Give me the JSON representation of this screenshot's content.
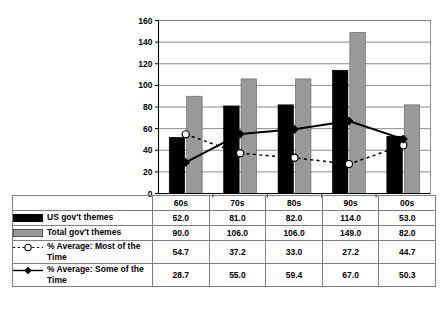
{
  "chart_data": {
    "type": "bar",
    "title": "",
    "subtitle": "",
    "xlabel": "",
    "ylabel": "",
    "categories": [
      "60s",
      "70s",
      "80s",
      "90s",
      "00s"
    ],
    "ylim": [
      0,
      160
    ],
    "y_ticks": [
      0,
      20,
      40,
      60,
      80,
      100,
      120,
      140,
      160
    ],
    "y_tick_labels": [
      "0",
      "20",
      "40",
      "60",
      "80",
      "100",
      "120",
      "140",
      "160"
    ],
    "grid": true,
    "legend_position": "table-below",
    "series": [
      {
        "name": "US gov't themes",
        "kind": "bar",
        "color": "#000000",
        "values": [
          52.0,
          81.0,
          82.0,
          114.0,
          53.0
        ],
        "display_values": [
          "52.0",
          "81.0",
          "82.0",
          "114.0",
          "53.0"
        ]
      },
      {
        "name": "Total gov't themes",
        "kind": "bar",
        "color": "#999999",
        "values": [
          90.0,
          106.0,
          106.0,
          149.0,
          82.0
        ],
        "display_values": [
          "90.0",
          "106.0",
          "106.0",
          "149.0",
          "82.0"
        ]
      },
      {
        "name": "% Average: Most of the Time",
        "kind": "line",
        "line_style": "dotted",
        "marker": "circle-open",
        "color": "#000000",
        "values": [
          54.7,
          37.2,
          33.0,
          27.2,
          44.7
        ],
        "display_values": [
          "54.7",
          "37.2",
          "33.0",
          "27.2",
          "44.7"
        ]
      },
      {
        "name": "% Average: Some of the Time",
        "kind": "line",
        "line_style": "solid",
        "marker": "diamond-filled",
        "color": "#000000",
        "values": [
          28.7,
          55.0,
          59.4,
          67.0,
          50.3
        ],
        "display_values": [
          "28.7",
          "55.0",
          "59.4",
          "67.0",
          "50.3"
        ]
      }
    ]
  },
  "legend_table": {
    "header_blank": "",
    "columns": [
      "60s",
      "70s",
      "80s",
      "90s",
      "00s"
    ],
    "rows": [
      {
        "symbol": "black-swatch-icon",
        "label": "US gov't themes",
        "values": [
          "52.0",
          "81.0",
          "82.0",
          "114.0",
          "53.0"
        ]
      },
      {
        "symbol": "gray-swatch-icon",
        "label": "Total gov't themes",
        "values": [
          "90.0",
          "106.0",
          "106.0",
          "149.0",
          "82.0"
        ]
      },
      {
        "symbol": "dotted-line-open-circle-icon",
        "label": "% Average: Most of the Time",
        "values": [
          "54.7",
          "37.2",
          "33.0",
          "27.2",
          "44.7"
        ]
      },
      {
        "symbol": "solid-line-diamond-icon",
        "label": "% Average: Some of the Time",
        "values": [
          "28.7",
          "55.0",
          "59.4",
          "67.0",
          "50.3"
        ]
      }
    ]
  },
  "colors": {
    "series_black": "#000000",
    "series_gray": "#999999",
    "gridline": "#808080",
    "axis": "#000000",
    "background": "#ffffff"
  }
}
